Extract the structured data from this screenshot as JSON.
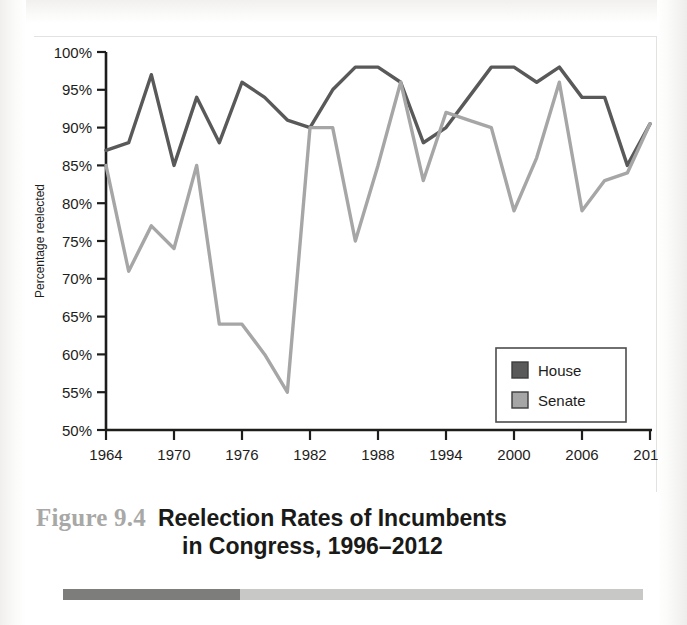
{
  "figure": {
    "number_label": "Figure 9.4",
    "title_line1": "Reelection Rates of Incumbents",
    "title_line2": "in Congress, 1996–2012"
  },
  "legend": {
    "position": "inside-bottom-right",
    "entries": [
      {
        "label": "House",
        "color": "#595959"
      },
      {
        "label": "Senate",
        "color": "#a6a6a6"
      }
    ]
  },
  "accent_bar": {
    "dark_color": "#7d7d7b",
    "light_color": "#c8c8c6",
    "dark_fraction": 0.305
  },
  "colors": {
    "house": "#595959",
    "senate": "#a6a6a6",
    "axis": "#1d1d1b",
    "text": "#1d1d1b"
  },
  "chart_data": {
    "type": "line",
    "title": "Reelection Rates of Incumbents in Congress, 1996–2012",
    "xlabel": "",
    "ylabel": "Percentage reelected",
    "grid": false,
    "legend_position": "inside-bottom-right",
    "xlim": [
      1964,
      2012
    ],
    "ylim": [
      50,
      100
    ],
    "yticks": [
      50,
      55,
      60,
      65,
      70,
      75,
      80,
      85,
      90,
      95,
      100
    ],
    "ytick_labels": [
      "50%",
      "55%",
      "60%",
      "65%",
      "70%",
      "75%",
      "80%",
      "85%",
      "90%",
      "95%",
      "100%"
    ],
    "xticks": [
      1964,
      1970,
      1976,
      1982,
      1988,
      1994,
      2000,
      2006,
      2012
    ],
    "xtick_labels": [
      "1964",
      "1970",
      "1976",
      "1982",
      "1988",
      "1994",
      "2000",
      "2006",
      "2012"
    ],
    "x": [
      1964,
      1966,
      1968,
      1970,
      1972,
      1974,
      1976,
      1978,
      1980,
      1982,
      1984,
      1986,
      1988,
      1990,
      1992,
      1994,
      1996,
      1998,
      2000,
      2002,
      2004,
      2006,
      2008,
      2010,
      2012
    ],
    "series": [
      {
        "name": "House",
        "color": "#595959",
        "values": [
          87,
          88,
          97,
          85,
          94,
          88,
          96,
          94,
          91,
          90,
          95,
          98,
          98,
          96,
          88,
          90,
          94,
          98,
          98,
          96,
          98,
          94,
          94,
          85,
          90.5
        ]
      },
      {
        "name": "Senate",
        "color": "#a6a6a6",
        "values": [
          85,
          71,
          77,
          74,
          85,
          64,
          64,
          60,
          55,
          90,
          90,
          75,
          85,
          96,
          83,
          92,
          91,
          90,
          79,
          86,
          96,
          79,
          83,
          84,
          90.5
        ]
      }
    ]
  }
}
